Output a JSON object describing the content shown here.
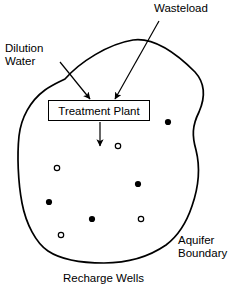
{
  "figure": {
    "stroke_color": "#000000",
    "background_color": "#ffffff"
  },
  "labels": {
    "wasteload": "Wasteload",
    "dilution_water": "Dilution\nWater",
    "aquifer_boundary": "Aquifer\nBoundary",
    "recharge_wells": "Recharge Wells"
  },
  "treatment_plant": {
    "label": "Treatment Plant"
  },
  "arrows": [
    {
      "name": "dilution-water-arrow",
      "from": [
        60,
        62
      ],
      "to": [
        90,
        99
      ]
    },
    {
      "name": "wasteload-arrow",
      "from": [
        159,
        21
      ],
      "to": [
        115,
        99
      ]
    },
    {
      "name": "plant-output-arrow",
      "from": [
        100,
        122
      ],
      "to": [
        100,
        146
      ]
    }
  ],
  "wells": [
    {
      "name": "well-filled-1",
      "type": "filled",
      "x": 168,
      "y": 122
    },
    {
      "name": "well-open-1",
      "type": "open",
      "x": 118,
      "y": 146
    },
    {
      "name": "well-open-2",
      "type": "open",
      "x": 57,
      "y": 168
    },
    {
      "name": "well-filled-2",
      "type": "filled",
      "x": 138,
      "y": 184
    },
    {
      "name": "well-filled-3",
      "type": "filled",
      "x": 49,
      "y": 202
    },
    {
      "name": "well-filled-4",
      "type": "filled",
      "x": 92,
      "y": 219
    },
    {
      "name": "well-open-3",
      "type": "open",
      "x": 141,
      "y": 219
    },
    {
      "name": "well-open-4",
      "type": "open",
      "x": 61,
      "y": 235
    }
  ],
  "aquifer_outline_path": "M 65 79 C 80 62, 108 44, 133 40 C 155 37, 178 55, 195 72 C 204 82, 206 96, 199 112 C 192 126, 192 136, 196 150 C 200 166, 199 186, 192 206 C 186 224, 178 236, 166 245 C 150 256, 128 263, 104 263 C 80 263, 60 259, 48 251 C 36 243, 26 224, 22 203 C 18 182, 17 155, 19 136 C 21 118, 30 101, 45 90 C 52 85, 59 82, 65 79 Z"
}
